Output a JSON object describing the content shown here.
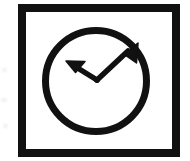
{
  "icon": {
    "name": "trend-change-double-arrow-icon",
    "label": "Double-headed arrow in circle",
    "description": "Black square outline frame enclosing a black circle outline with a V-shaped double-headed arrow inside, both tips pointing outward and upward",
    "style": "monochrome line art",
    "colors": {
      "stroke": "#111111",
      "fill": "#ffffff",
      "background": "#ffffff",
      "smudge": "#f0f0f0"
    },
    "frame": {
      "name": "square-frame",
      "x": 18,
      "y": 4,
      "width": 162,
      "height": 153,
      "stroke_width": 8
    },
    "circle": {
      "name": "circle-outline",
      "center_x": 96,
      "center_y": 81,
      "radius": 54,
      "stroke_width": 7
    },
    "arrow": {
      "name": "double-headed-arrow",
      "vertex_x": 97,
      "vertex_y": 80,
      "left_tip_x": 67,
      "left_tip_y": 62,
      "right_tip_x": 137,
      "right_tip_y": 44,
      "shaft_width": 5,
      "head_length": 16
    }
  }
}
